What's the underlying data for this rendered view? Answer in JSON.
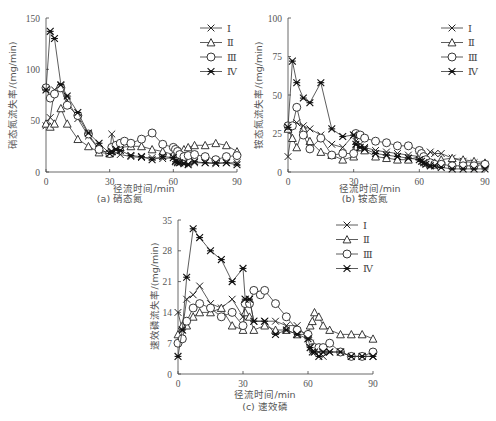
{
  "chart_data": [
    {
      "type": "line",
      "panel": "a",
      "caption": "(a) 硝态氮",
      "xlabel": "径流时间/min",
      "ylabel": "硝态氮流失率/(mg/min)",
      "xlim": [
        0,
        90
      ],
      "ylim": [
        0,
        150
      ],
      "xticks": [
        0,
        30,
        60,
        90
      ],
      "yticks": [
        0,
        50,
        100,
        150
      ],
      "grid": false,
      "legend_position": "upper right",
      "series": [
        {
          "name": "Ⅰ",
          "marker": "x",
          "x": [
            0,
            2,
            4,
            7,
            10,
            15,
            20,
            25,
            30,
            31,
            33,
            35,
            40,
            45,
            50,
            55,
            60,
            61,
            62,
            63,
            65,
            67,
            70,
            75,
            80,
            85,
            90
          ],
          "y": [
            45,
            53,
            80,
            84,
            70,
            52,
            35,
            22,
            18,
            37,
            20,
            17,
            15,
            14,
            14,
            13,
            14,
            11,
            10,
            9,
            9,
            8,
            9,
            9,
            8,
            9,
            9
          ]
        },
        {
          "name": "Ⅱ",
          "marker": "triangle",
          "x": [
            0,
            2,
            4,
            7,
            10,
            15,
            20,
            25,
            30,
            31,
            33,
            35,
            40,
            45,
            50,
            55,
            60,
            61,
            62,
            63,
            65,
            67,
            70,
            75,
            80,
            85,
            90
          ],
          "y": [
            47,
            44,
            47,
            62,
            47,
            32,
            25,
            19,
            18,
            20,
            22,
            24,
            25,
            25,
            22,
            20,
            17,
            16,
            18,
            20,
            22,
            24,
            26,
            26,
            28,
            26,
            20
          ]
        },
        {
          "name": "Ⅲ",
          "marker": "circle",
          "x": [
            0,
            2,
            4,
            7,
            10,
            15,
            20,
            25,
            30,
            31,
            33,
            35,
            37,
            40,
            45,
            50,
            55,
            60,
            61,
            62,
            63,
            65,
            67,
            70,
            75,
            80,
            85,
            90
          ],
          "y": [
            82,
            72,
            76,
            82,
            65,
            55,
            37,
            22,
            18,
            24,
            26,
            28,
            30,
            28,
            32,
            38,
            27,
            24,
            22,
            20,
            17,
            15,
            16,
            17,
            15,
            12,
            15,
            16
          ]
        },
        {
          "name": "Ⅳ",
          "marker": "star",
          "x": [
            0,
            2,
            4,
            7,
            10,
            15,
            20,
            25,
            30,
            31,
            33,
            35,
            40,
            45,
            50,
            55,
            60,
            61,
            62,
            63,
            65,
            67,
            70,
            75,
            80,
            85,
            90
          ],
          "y": [
            80,
            137,
            130,
            85,
            74,
            58,
            38,
            28,
            18,
            20,
            22,
            21,
            16,
            15,
            12,
            15,
            14,
            10,
            9,
            9,
            8,
            7,
            10,
            9,
            9,
            9,
            7
          ]
        }
      ]
    },
    {
      "type": "line",
      "panel": "b",
      "caption": "(b) 铵态氮",
      "xlabel": "径流时间/min",
      "ylabel": "铵态氮流失率/(mg/min)",
      "xlim": [
        0,
        90
      ],
      "ylim": [
        0,
        100
      ],
      "xticks": [
        0,
        30,
        60,
        90
      ],
      "yticks": [
        0,
        25,
        50,
        75,
        100
      ],
      "grid": false,
      "legend_position": "upper right",
      "series": [
        {
          "name": "Ⅰ",
          "marker": "x",
          "x": [
            0,
            2,
            4,
            7,
            10,
            15,
            20,
            25,
            30,
            31,
            33,
            35,
            40,
            45,
            50,
            55,
            60,
            61,
            62,
            63,
            65,
            67,
            70,
            75,
            80,
            85,
            90
          ],
          "y": [
            10,
            30,
            32,
            30,
            28,
            24,
            18,
            16,
            24,
            20,
            18,
            16,
            14,
            13,
            12,
            11,
            10,
            9,
            8,
            10,
            13,
            12,
            12,
            9,
            7,
            6,
            5
          ]
        },
        {
          "name": "Ⅱ",
          "marker": "triangle",
          "x": [
            0,
            2,
            4,
            7,
            10,
            15,
            20,
            25,
            30,
            31,
            33,
            35,
            40,
            45,
            50,
            55,
            60,
            61,
            62,
            63,
            65,
            67,
            70,
            75,
            80,
            85,
            90
          ],
          "y": [
            28,
            22,
            16,
            28,
            20,
            13,
            11,
            8,
            10,
            16,
            16,
            14,
            10,
            9,
            8,
            8,
            10,
            9,
            7,
            6,
            5,
            6,
            8,
            9,
            8,
            7,
            6
          ]
        },
        {
          "name": "Ⅲ",
          "marker": "circle",
          "x": [
            0,
            2,
            4,
            7,
            10,
            15,
            20,
            25,
            30,
            31,
            33,
            35,
            40,
            45,
            50,
            55,
            60,
            61,
            62,
            63,
            65,
            67,
            70,
            75,
            80,
            85,
            90
          ],
          "y": [
            30,
            30,
            42,
            24,
            15,
            22,
            11,
            12,
            12,
            25,
            24,
            22,
            20,
            19,
            17,
            17,
            14,
            12,
            10,
            8,
            6,
            5,
            5,
            4,
            4,
            4,
            5
          ]
        },
        {
          "name": "Ⅳ",
          "marker": "star",
          "x": [
            0,
            2,
            4,
            7,
            10,
            15,
            20,
            25,
            30,
            31,
            33,
            35,
            40,
            45,
            50,
            55,
            60,
            61,
            62,
            63,
            65,
            67,
            70,
            75,
            80,
            85,
            90
          ],
          "y": [
            29,
            72,
            58,
            48,
            45,
            58,
            28,
            23,
            24,
            18,
            16,
            15,
            12,
            11,
            10,
            9,
            8,
            7,
            6,
            5,
            4,
            4,
            3,
            2,
            2,
            2,
            2
          ]
        }
      ]
    },
    {
      "type": "line",
      "panel": "c",
      "caption": "(c) 速效磷",
      "xlabel": "径流时间/min",
      "ylabel": "速效磷流失率/(mg/min)",
      "xlim": [
        0,
        90
      ],
      "ylim": [
        0,
        35
      ],
      "xticks": [
        0,
        30,
        60,
        90
      ],
      "yticks": [
        0,
        7,
        14,
        21,
        28,
        35
      ],
      "grid": false,
      "legend_position": "upper right",
      "series": [
        {
          "name": "Ⅰ",
          "marker": "x",
          "x": [
            0,
            2,
            4,
            7,
            10,
            15,
            20,
            25,
            30,
            31,
            33,
            35,
            40,
            45,
            50,
            55,
            60,
            61,
            62,
            63,
            65,
            67,
            70,
            75,
            80,
            85,
            90
          ],
          "y": [
            14,
            10,
            17,
            18,
            20,
            16,
            15,
            17,
            13,
            17,
            17,
            12,
            12,
            12,
            11,
            11,
            8,
            7,
            6,
            5,
            5,
            4,
            5,
            5,
            4,
            4,
            4
          ]
        },
        {
          "name": "Ⅱ",
          "marker": "triangle",
          "x": [
            0,
            2,
            4,
            7,
            10,
            15,
            20,
            25,
            30,
            31,
            33,
            35,
            40,
            45,
            50,
            55,
            60,
            61,
            62,
            63,
            65,
            67,
            70,
            75,
            80,
            85,
            90
          ],
          "y": [
            9,
            11,
            11,
            13,
            14,
            14,
            15,
            11,
            10,
            14,
            13,
            10,
            11,
            10,
            10,
            9,
            9,
            11,
            12,
            14,
            13,
            11,
            10,
            9,
            9,
            9,
            8
          ]
        },
        {
          "name": "Ⅲ",
          "marker": "circle",
          "x": [
            0,
            2,
            4,
            7,
            10,
            15,
            20,
            25,
            30,
            31,
            33,
            35,
            38,
            40,
            45,
            50,
            55,
            60,
            61,
            62,
            63,
            65,
            67,
            70,
            75,
            80,
            85,
            90
          ],
          "y": [
            7,
            8,
            12,
            15,
            16,
            15,
            13,
            14,
            11,
            16,
            16,
            19,
            18,
            19,
            16,
            13,
            10,
            9,
            7,
            6,
            6,
            6,
            6,
            7,
            5,
            4,
            4,
            5
          ]
        },
        {
          "name": "Ⅳ",
          "marker": "star",
          "x": [
            0,
            2,
            4,
            7,
            10,
            15,
            20,
            25,
            30,
            31,
            33,
            35,
            40,
            45,
            50,
            55,
            60,
            61,
            62,
            63,
            65,
            67,
            70,
            75,
            80,
            85,
            90
          ],
          "y": [
            4,
            10,
            22,
            33,
            31,
            28,
            26,
            21,
            24,
            17,
            17,
            12,
            12,
            9,
            10,
            9,
            8,
            6,
            5,
            5,
            4,
            5,
            5,
            5,
            4,
            4,
            4
          ]
        }
      ]
    }
  ]
}
